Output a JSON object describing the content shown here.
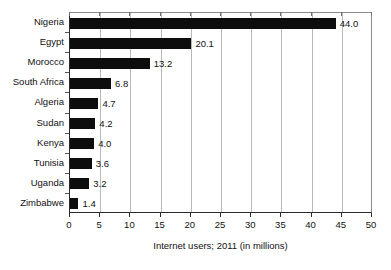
{
  "chart_data": {
    "type": "bar",
    "orientation": "horizontal",
    "title": "",
    "xlabel": "Internet users; 2011 (in millions)",
    "ylabel": "",
    "xlim": [
      0,
      50
    ],
    "xticks": [
      0,
      5,
      10,
      15,
      20,
      25,
      30,
      35,
      40,
      45,
      50
    ],
    "xtick_labels": [
      "0",
      "5",
      "10",
      "15",
      "20",
      "25",
      "30",
      "35",
      "40",
      "45",
      "50"
    ],
    "grid": true,
    "grid_axis": "x",
    "legend": null,
    "bar_color": "#0d0d0d",
    "grid_color": "#b9b9b9",
    "categories": [
      "Nigeria",
      "Egypt",
      "Morocco",
      "South Africa",
      "Algeria",
      "Sudan",
      "Kenya",
      "Tunisia",
      "Uganda",
      "Zimbabwe"
    ],
    "values": [
      44.0,
      20.1,
      13.2,
      6.8,
      4.7,
      4.2,
      4.0,
      3.6,
      3.2,
      1.4
    ],
    "value_labels": [
      "44.0",
      "20.1",
      "13.2",
      "6.8",
      "4.7",
      "4.2",
      "4.0",
      "3.6",
      "3.2",
      "1.4"
    ]
  }
}
